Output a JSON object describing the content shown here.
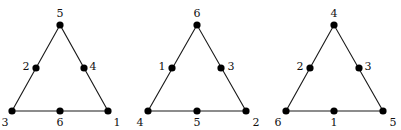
{
  "diagram": {
    "title": "",
    "colors": {
      "edge": "#1a1a1a",
      "node": "#000000",
      "label": "#111111",
      "background": "#ffffff"
    },
    "panels": [
      {
        "id": "triangle-1",
        "vertices": {
          "top": {
            "x": 60,
            "y": 25,
            "label": "5"
          },
          "bottom_left": {
            "x": 12,
            "y": 111,
            "label": "3"
          },
          "bottom_right": {
            "x": 108,
            "y": 111,
            "label": "1"
          }
        },
        "midpoints": {
          "left": {
            "x": 36,
            "y": 68,
            "label": "2"
          },
          "right": {
            "x": 84,
            "y": 68,
            "label": "4"
          },
          "bottom": {
            "x": 60,
            "y": 111,
            "label": "6"
          }
        },
        "labels": [
          {
            "text": "5",
            "x": 60,
            "y": 13
          },
          {
            "text": "2",
            "x": 26,
            "y": 66
          },
          {
            "text": "4",
            "x": 93,
            "y": 66
          },
          {
            "text": "3",
            "x": 5,
            "y": 122
          },
          {
            "text": "6",
            "x": 60,
            "y": 122
          },
          {
            "text": "1",
            "x": 117,
            "y": 122
          }
        ]
      },
      {
        "id": "triangle-2",
        "vertices": {
          "top": {
            "x": 197,
            "y": 25,
            "label": "6"
          },
          "bottom_left": {
            "x": 148,
            "y": 111,
            "label": "4"
          },
          "bottom_right": {
            "x": 246,
            "y": 111,
            "label": "2"
          }
        },
        "midpoints": {
          "left": {
            "x": 172,
            "y": 68,
            "label": "1"
          },
          "right": {
            "x": 221,
            "y": 68,
            "label": "3"
          },
          "bottom": {
            "x": 197,
            "y": 111,
            "label": "5"
          }
        },
        "labels": [
          {
            "text": "6",
            "x": 197,
            "y": 13
          },
          {
            "text": "1",
            "x": 162,
            "y": 66
          },
          {
            "text": "3",
            "x": 231,
            "y": 66
          },
          {
            "text": "4",
            "x": 140,
            "y": 122
          },
          {
            "text": "5",
            "x": 197,
            "y": 122
          },
          {
            "text": "2",
            "x": 256,
            "y": 122
          }
        ]
      },
      {
        "id": "triangle-3",
        "vertices": {
          "top": {
            "x": 334,
            "y": 25,
            "label": "4"
          },
          "bottom_left": {
            "x": 286,
            "y": 111,
            "label": "6"
          },
          "bottom_right": {
            "x": 383,
            "y": 111,
            "label": "5"
          }
        },
        "midpoints": {
          "left": {
            "x": 310,
            "y": 68,
            "label": "2"
          },
          "right": {
            "x": 359,
            "y": 68,
            "label": "3"
          },
          "bottom": {
            "x": 334,
            "y": 111,
            "label": "1"
          }
        },
        "labels": [
          {
            "text": "4",
            "x": 334,
            "y": 13
          },
          {
            "text": "2",
            "x": 300,
            "y": 66
          },
          {
            "text": "3",
            "x": 368,
            "y": 66
          },
          {
            "text": "6",
            "x": 278,
            "y": 122
          },
          {
            "text": "1",
            "x": 334,
            "y": 122
          },
          {
            "text": "5",
            "x": 393,
            "y": 122
          }
        ]
      }
    ]
  }
}
